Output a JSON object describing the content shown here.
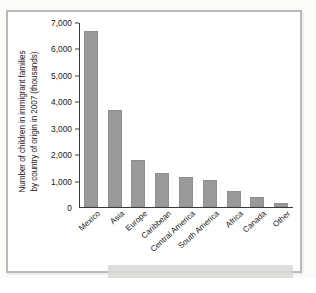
{
  "chart_data": {
    "type": "bar",
    "title": "",
    "subtitle": "",
    "xlabel": "",
    "ylabel": "Number of children in immigrant families by country of origin in 2007 (thousands)",
    "ylabel_line1": "Number of children in immigrant families",
    "ylabel_line2": "by country of origin in 2007 (thousands)",
    "categories": [
      "Mexico",
      "Asia",
      "Europe",
      "Caribbean",
      "Central America",
      "South America",
      "Africa",
      "Canada",
      "Other"
    ],
    "values": [
      6700,
      3690,
      1780,
      1290,
      1140,
      1020,
      600,
      390,
      160
    ],
    "ylim": [
      0,
      7000
    ],
    "ytick_values": [
      0,
      1000,
      2000,
      3000,
      4000,
      5000,
      6000,
      7000
    ],
    "ytick_labels": [
      "0",
      "1,000",
      "2,000",
      "3,000",
      "4,000",
      "5,000",
      "6,000",
      "7,000"
    ],
    "grid": false,
    "legend": false,
    "legend_position": "none",
    "bar_color": "#9a9a9a",
    "axis_color": "#3a3a3a",
    "background_color": "#ffffff"
  },
  "figure": {
    "frame_color": "#b9bbb8",
    "page_background": "#fbfbfa"
  }
}
